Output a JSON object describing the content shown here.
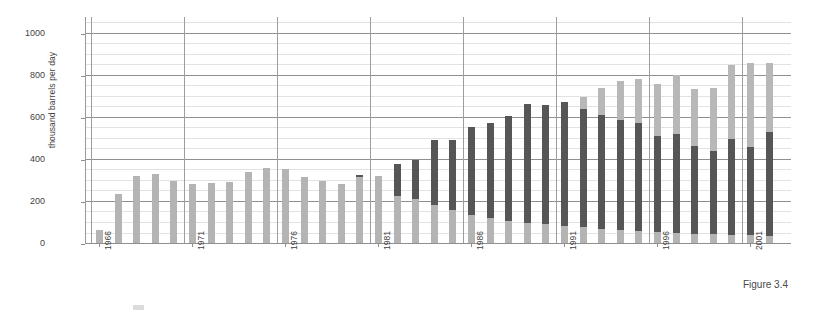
{
  "figure": {
    "caption": "Figure 3.4"
  },
  "legend": {
    "items": [
      {
        "label": "",
        "color": "#b4b4b4"
      }
    ]
  },
  "chart_data": {
    "type": "bar",
    "stacked": true,
    "title": "",
    "subtitle": "",
    "xlabel": "",
    "ylabel": "thousand barrels per day",
    "ylim": [
      0,
      1080
    ],
    "yticks": [
      0,
      200,
      400,
      600,
      800,
      1000
    ],
    "ytick_labels": [
      "0",
      "200",
      "400",
      "600",
      "800",
      "1000"
    ],
    "minor_tick_step": 50,
    "grid": true,
    "grid_vertical_step": 5,
    "legend_position": "bottom-left",
    "x_tick_labels": [
      "1966",
      "1971",
      "1976",
      "1981",
      "1986",
      "1991",
      "1996",
      "2001"
    ],
    "x_tick_rotation": -90,
    "categories": [
      "1966",
      "1967",
      "1968",
      "1969",
      "1970",
      "1971",
      "1972",
      "1973",
      "1974",
      "1975",
      "1976",
      "1977",
      "1978",
      "1979",
      "1980",
      "1981",
      "1982",
      "1983",
      "1984",
      "1985",
      "1986",
      "1987",
      "1988",
      "1989",
      "1990",
      "1991",
      "1992",
      "1993",
      "1994",
      "1995",
      "1996",
      "1997",
      "1998",
      "1999",
      "2000",
      "2001",
      "2002"
    ],
    "series": [
      {
        "name": "lower",
        "color": "#b4b4b4",
        "values": [
          65,
          240,
          325,
          333,
          300,
          285,
          290,
          295,
          345,
          362,
          355,
          320,
          302,
          287,
          318,
          325,
          230,
          215,
          185,
          160,
          140,
          125,
          110,
          100,
          95,
          88,
          80,
          72,
          66,
          62,
          58,
          54,
          50,
          46,
          44,
          42,
          40
        ]
      },
      {
        "name": "middle",
        "color": "#565656",
        "values": [
          0,
          0,
          0,
          0,
          0,
          0,
          0,
          0,
          0,
          0,
          0,
          0,
          0,
          0,
          10,
          0,
          150,
          185,
          310,
          335,
          415,
          450,
          500,
          565,
          568,
          590,
          562,
          540,
          522,
          515,
          458,
          470,
          418,
          398,
          455,
          418,
          495
        ]
      },
      {
        "name": "upper",
        "color": "#b8b8b8",
        "values": [
          0,
          0,
          0,
          0,
          0,
          0,
          0,
          0,
          0,
          0,
          0,
          0,
          0,
          0,
          0,
          0,
          0,
          0,
          0,
          0,
          0,
          0,
          0,
          0,
          0,
          0,
          58,
          130,
          188,
          210,
          245,
          280,
          272,
          300,
          355,
          400,
          325
        ]
      }
    ],
    "totals": [
      65,
      240,
      325,
      333,
      300,
      285,
      290,
      295,
      345,
      362,
      355,
      320,
      302,
      287,
      328,
      325,
      380,
      400,
      495,
      495,
      555,
      575,
      610,
      665,
      663,
      678,
      700,
      742,
      776,
      787,
      761,
      804,
      740,
      744,
      854,
      860,
      860
    ]
  }
}
